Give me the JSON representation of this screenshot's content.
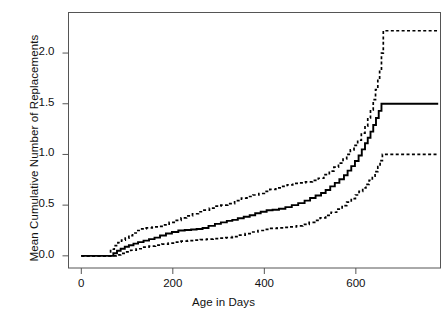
{
  "chart_data": {
    "type": "line",
    "subtype": "step",
    "title": "",
    "xlabel": "Age in Days",
    "ylabel": "Mean Cumulative Number of Replacements",
    "xlim": [
      -28,
      785
    ],
    "ylim": [
      -0.12,
      2.4
    ],
    "xticks": [
      0,
      200,
      400,
      600
    ],
    "xtick_labels": [
      "0",
      "200",
      "400",
      "600"
    ],
    "yticks": [
      0.0,
      0.5,
      1.0,
      1.5,
      2.0
    ],
    "ytick_labels": [
      "0.0",
      "0.5",
      "1.0",
      "1.5",
      "2.0"
    ],
    "grid": false,
    "legend": false,
    "box": true,
    "series": [
      {
        "name": "Upper 95% confidence limit",
        "style": "dotted",
        "color": "#000000",
        "points": [
          [
            0,
            0.0
          ],
          [
            60,
            0.0
          ],
          [
            64,
            0.065
          ],
          [
            72,
            0.1
          ],
          [
            80,
            0.13
          ],
          [
            88,
            0.155
          ],
          [
            96,
            0.175
          ],
          [
            104,
            0.2
          ],
          [
            112,
            0.225
          ],
          [
            120,
            0.25
          ],
          [
            130,
            0.265
          ],
          [
            142,
            0.275
          ],
          [
            155,
            0.285
          ],
          [
            168,
            0.29
          ],
          [
            180,
            0.305
          ],
          [
            192,
            0.33
          ],
          [
            205,
            0.35
          ],
          [
            218,
            0.375
          ],
          [
            230,
            0.395
          ],
          [
            243,
            0.415
          ],
          [
            256,
            0.435
          ],
          [
            268,
            0.45
          ],
          [
            280,
            0.47
          ],
          [
            292,
            0.49
          ],
          [
            305,
            0.5
          ],
          [
            320,
            0.515
          ],
          [
            335,
            0.545
          ],
          [
            350,
            0.57
          ],
          [
            362,
            0.585
          ],
          [
            375,
            0.6
          ],
          [
            388,
            0.615
          ],
          [
            400,
            0.635
          ],
          [
            412,
            0.655
          ],
          [
            425,
            0.67
          ],
          [
            438,
            0.685
          ],
          [
            450,
            0.7
          ],
          [
            462,
            0.715
          ],
          [
            475,
            0.72
          ],
          [
            490,
            0.73
          ],
          [
            505,
            0.745
          ],
          [
            518,
            0.765
          ],
          [
            530,
            0.8
          ],
          [
            542,
            0.835
          ],
          [
            552,
            0.875
          ],
          [
            562,
            0.915
          ],
          [
            572,
            0.955
          ],
          [
            580,
            1.0
          ],
          [
            588,
            1.045
          ],
          [
            596,
            1.09
          ],
          [
            604,
            1.14
          ],
          [
            612,
            1.21
          ],
          [
            620,
            1.28
          ],
          [
            626,
            1.36
          ],
          [
            632,
            1.44
          ],
          [
            638,
            1.54
          ],
          [
            643,
            1.64
          ],
          [
            648,
            1.74
          ],
          [
            652,
            1.83
          ],
          [
            656,
            2.0
          ],
          [
            660,
            2.22
          ],
          [
            780,
            2.22
          ]
        ]
      },
      {
        "name": "Mean cumulative function (MCF)",
        "style": "solid",
        "color": "#000000",
        "points": [
          [
            0,
            0.0
          ],
          [
            62,
            0.0
          ],
          [
            70,
            0.025
          ],
          [
            78,
            0.05
          ],
          [
            86,
            0.07
          ],
          [
            95,
            0.09
          ],
          [
            104,
            0.105
          ],
          [
            114,
            0.12
          ],
          [
            124,
            0.135
          ],
          [
            136,
            0.15
          ],
          [
            148,
            0.165
          ],
          [
            160,
            0.18
          ],
          [
            172,
            0.2
          ],
          [
            185,
            0.22
          ],
          [
            198,
            0.235
          ],
          [
            212,
            0.25
          ],
          [
            226,
            0.255
          ],
          [
            240,
            0.26
          ],
          [
            252,
            0.265
          ],
          [
            265,
            0.275
          ],
          [
            278,
            0.295
          ],
          [
            292,
            0.315
          ],
          [
            305,
            0.33
          ],
          [
            318,
            0.345
          ],
          [
            330,
            0.355
          ],
          [
            342,
            0.37
          ],
          [
            355,
            0.385
          ],
          [
            368,
            0.4
          ],
          [
            380,
            0.42
          ],
          [
            392,
            0.435
          ],
          [
            405,
            0.45
          ],
          [
            418,
            0.455
          ],
          [
            432,
            0.465
          ],
          [
            446,
            0.48
          ],
          [
            460,
            0.5
          ],
          [
            474,
            0.52
          ],
          [
            488,
            0.545
          ],
          [
            500,
            0.57
          ],
          [
            512,
            0.595
          ],
          [
            524,
            0.62
          ],
          [
            534,
            0.65
          ],
          [
            544,
            0.685
          ],
          [
            554,
            0.72
          ],
          [
            564,
            0.755
          ],
          [
            574,
            0.795
          ],
          [
            582,
            0.84
          ],
          [
            590,
            0.885
          ],
          [
            598,
            0.935
          ],
          [
            606,
            0.99
          ],
          [
            613,
            1.05
          ],
          [
            620,
            1.11
          ],
          [
            626,
            1.165
          ],
          [
            632,
            1.225
          ],
          [
            638,
            1.29
          ],
          [
            644,
            1.36
          ],
          [
            650,
            1.43
          ],
          [
            656,
            1.5
          ],
          [
            780,
            1.5
          ]
        ]
      },
      {
        "name": "Lower 95% confidence limit",
        "style": "dotted",
        "color": "#000000",
        "points": [
          [
            0,
            0.0
          ],
          [
            66,
            0.0
          ],
          [
            76,
            0.01
          ],
          [
            86,
            0.025
          ],
          [
            96,
            0.04
          ],
          [
            108,
            0.055
          ],
          [
            120,
            0.07
          ],
          [
            134,
            0.085
          ],
          [
            148,
            0.095
          ],
          [
            162,
            0.105
          ],
          [
            176,
            0.115
          ],
          [
            190,
            0.125
          ],
          [
            204,
            0.135
          ],
          [
            218,
            0.145
          ],
          [
            232,
            0.15
          ],
          [
            246,
            0.155
          ],
          [
            260,
            0.16
          ],
          [
            274,
            0.165
          ],
          [
            288,
            0.17
          ],
          [
            302,
            0.175
          ],
          [
            316,
            0.18
          ],
          [
            330,
            0.19
          ],
          [
            344,
            0.205
          ],
          [
            358,
            0.22
          ],
          [
            372,
            0.235
          ],
          [
            386,
            0.25
          ],
          [
            400,
            0.26
          ],
          [
            414,
            0.27
          ],
          [
            428,
            0.275
          ],
          [
            442,
            0.28
          ],
          [
            456,
            0.285
          ],
          [
            470,
            0.295
          ],
          [
            484,
            0.31
          ],
          [
            498,
            0.33
          ],
          [
            510,
            0.35
          ],
          [
            522,
            0.375
          ],
          [
            534,
            0.4
          ],
          [
            546,
            0.43
          ],
          [
            558,
            0.46
          ],
          [
            570,
            0.495
          ],
          [
            580,
            0.53
          ],
          [
            590,
            0.565
          ],
          [
            599,
            0.6
          ],
          [
            607,
            0.635
          ],
          [
            615,
            0.67
          ],
          [
            622,
            0.705
          ],
          [
            629,
            0.745
          ],
          [
            636,
            0.785
          ],
          [
            642,
            0.83
          ],
          [
            648,
            0.88
          ],
          [
            653,
            0.94
          ],
          [
            658,
            1.0
          ],
          [
            780,
            1.0
          ]
        ]
      }
    ]
  },
  "axis": {
    "x_title": "Age in Days",
    "y_title": "Mean Cumulative Number of Replacements"
  }
}
